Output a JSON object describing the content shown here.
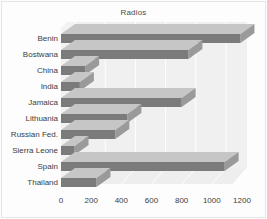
{
  "chart_data": {
    "type": "bar",
    "orientation": "horizontal",
    "style": "3d",
    "title": "Radios",
    "xlabel": "",
    "ylabel": "",
    "categories": [
      "Benin",
      "Bostwana",
      "China",
      "India",
      "Jamaica",
      "Lithuania",
      "Russian Fed.",
      "Sierra Leone",
      "Spain",
      "Thailand"
    ],
    "values": [
      1190,
      845,
      160,
      125,
      800,
      440,
      360,
      90,
      1085,
      235
    ],
    "xlim": [
      0,
      1290
    ],
    "xticks": [
      0,
      200,
      400,
      600,
      800,
      1000,
      1200
    ],
    "xtick_labels": [
      "0",
      "200",
      "400",
      "600",
      "800",
      "1000",
      "1200"
    ],
    "grid": true,
    "legend": null,
    "series": [
      {
        "name": "Radios",
        "values": [
          1190,
          845,
          160,
          125,
          800,
          440,
          360,
          90,
          1085,
          235
        ]
      }
    ],
    "colors": {
      "bar_front": "#7b7b7b",
      "bar_top": "#c6c6c6",
      "bar_side": "#9a9a9a",
      "floor": "#ededed",
      "wall": "#f1f1f1",
      "grid": "#ffffff",
      "text": "#3c3c3c",
      "background": "#fdfdfd"
    }
  }
}
